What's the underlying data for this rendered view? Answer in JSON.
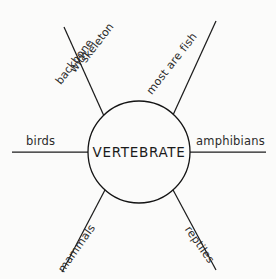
{
  "diagram": {
    "type": "spider-web-concept-map",
    "center": {
      "label": "VERTEBRATE"
    },
    "spokes": [
      {
        "id": "skeleton-with-backbone",
        "label": "skeleton with backbone",
        "lines": [
          "skeleton",
          "with",
          "backbone"
        ],
        "position": "top-left",
        "angle_deg": -52
      },
      {
        "id": "most-are-fish",
        "label": "most are fish",
        "position": "top-right",
        "angle_deg": -52
      },
      {
        "id": "birds",
        "label": "birds",
        "position": "left",
        "angle_deg": 0
      },
      {
        "id": "amphibians",
        "label": "amphibians",
        "position": "right",
        "angle_deg": 0
      },
      {
        "id": "mammals",
        "label": "mammals",
        "position": "bottom-left",
        "angle_deg": -55
      },
      {
        "id": "reptiles",
        "label": "reptiles",
        "position": "bottom-right",
        "angle_deg": 55
      }
    ],
    "colors": {
      "background": "#f2f1ef",
      "surface": "#fbfbfa",
      "stroke": "#1d1d1d",
      "text": "#2b2b2b"
    }
  }
}
